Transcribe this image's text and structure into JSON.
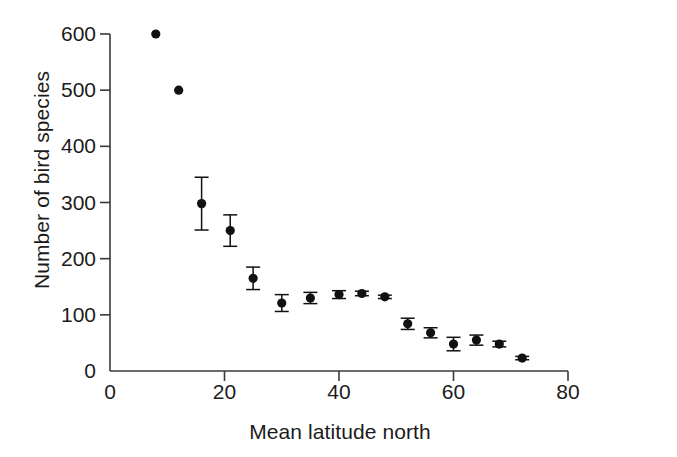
{
  "chart_data": {
    "type": "scatter",
    "title": "",
    "xlabel": "Mean latitude north",
    "ylabel": "Number of bird species",
    "xlim": [
      0,
      80
    ],
    "ylim": [
      0,
      600
    ],
    "xticks": [
      0,
      20,
      40,
      60,
      80
    ],
    "yticks": [
      0,
      100,
      200,
      300,
      400,
      500,
      600
    ],
    "xtick_labels": [
      "0",
      "20",
      "40",
      "60",
      "80"
    ],
    "ytick_labels": [
      "0",
      "100",
      "200",
      "300",
      "400",
      "500",
      "600"
    ],
    "grid": false,
    "legend": null,
    "marker": "filled-circle",
    "marker_color": "#111111",
    "errorbars": true,
    "x": [
      8,
      12,
      16,
      21,
      25,
      30,
      35,
      40,
      44,
      48,
      52,
      56,
      60,
      64,
      68,
      72
    ],
    "y": [
      600,
      500,
      298,
      250,
      165,
      121,
      130,
      136,
      138,
      132,
      84,
      68,
      48,
      55,
      48,
      23
    ],
    "yerr": [
      0,
      0,
      47,
      28,
      20,
      15,
      10,
      7,
      4,
      3,
      10,
      9,
      12,
      9,
      5,
      3
    ],
    "points": [
      {
        "x": 8,
        "y": 600,
        "err": 0
      },
      {
        "x": 12,
        "y": 500,
        "err": 0
      },
      {
        "x": 16,
        "y": 298,
        "err": 47
      },
      {
        "x": 21,
        "y": 250,
        "err": 28
      },
      {
        "x": 25,
        "y": 165,
        "err": 20
      },
      {
        "x": 30,
        "y": 121,
        "err": 15
      },
      {
        "x": 35,
        "y": 130,
        "err": 10
      },
      {
        "x": 40,
        "y": 136,
        "err": 7
      },
      {
        "x": 44,
        "y": 138,
        "err": 4
      },
      {
        "x": 48,
        "y": 132,
        "err": 3
      },
      {
        "x": 52,
        "y": 84,
        "err": 10
      },
      {
        "x": 56,
        "y": 68,
        "err": 9
      },
      {
        "x": 60,
        "y": 48,
        "err": 12
      },
      {
        "x": 64,
        "y": 55,
        "err": 9
      },
      {
        "x": 68,
        "y": 48,
        "err": 5
      },
      {
        "x": 72,
        "y": 23,
        "err": 3
      }
    ]
  },
  "axes": {
    "axis_color": "#3a3a3a",
    "background": "#ffffff"
  }
}
